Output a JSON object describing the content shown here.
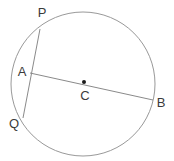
{
  "figure": {
    "background_color": "#ffffff",
    "stroke_color": "#999999",
    "chord_color": "#8a8a8a",
    "label_color": "#3b3b3b",
    "center_dot_color": "#1a1a1a",
    "circle": {
      "cx": 83,
      "cy": 84,
      "r": 72,
      "stroke_width": 1
    },
    "center_dot": {
      "cx": 84,
      "cy": 82,
      "r": 2
    },
    "segments": [
      {
        "name": "chord-pq",
        "from_label": "P",
        "to_label": "Q",
        "x1": 40,
        "y1": 29,
        "x2": 23,
        "y2": 118
      },
      {
        "name": "chord-ab",
        "from_label": "A",
        "to_label": "B",
        "x1": 30,
        "y1": 73,
        "x2": 153,
        "y2": 100
      }
    ],
    "labels": [
      {
        "id": "P",
        "text": "P",
        "x": 42,
        "y": 14
      },
      {
        "id": "A",
        "text": "A",
        "x": 22,
        "y": 73
      },
      {
        "id": "C",
        "text": "C",
        "x": 85,
        "y": 97
      },
      {
        "id": "B",
        "text": "B",
        "x": 161,
        "y": 104
      },
      {
        "id": "Q",
        "text": "Q",
        "x": 14,
        "y": 125
      }
    ]
  }
}
